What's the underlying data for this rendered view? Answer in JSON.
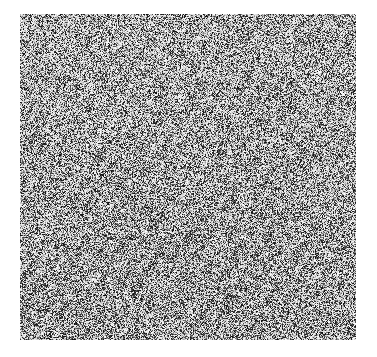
{
  "image": {
    "kind": "noise-texture",
    "title": "",
    "caption": "",
    "width": 377,
    "height": 357,
    "background_color": "#ffffff",
    "texture": {
      "name": "grayscale-random-noise",
      "x": 20,
      "y": 14,
      "width": 336,
      "height": 326,
      "grain_px": 1,
      "palette": {
        "darkest": "#000000",
        "dark": "#3a3a3a",
        "mid": "#8a8a8a",
        "light": "#c8c8c8",
        "lightest": "#ffffff"
      },
      "mean_level": 0.58,
      "contrast": 1.0,
      "density": 0.52,
      "anisotropy": "faint-diagonal-streaking",
      "regions": [
        {
          "name": "top-left",
          "relative_density": 0.44,
          "note": "lighter, sparser grain"
        },
        {
          "name": "top-right",
          "relative_density": 0.5,
          "note": "medium grain"
        },
        {
          "name": "center",
          "relative_density": 0.56,
          "note": "denser, faint diagonal clusters"
        },
        {
          "name": "bottom-left",
          "relative_density": 0.58,
          "note": "darker dense grain"
        },
        {
          "name": "bottom-right",
          "relative_density": 0.55,
          "note": "dense grain"
        }
      ],
      "edges": {
        "left": 20,
        "top": 14,
        "right": 356,
        "bottom": 340,
        "feather_px": 3
      }
    }
  },
  "overlay": {
    "labels": [],
    "annotations": []
  }
}
